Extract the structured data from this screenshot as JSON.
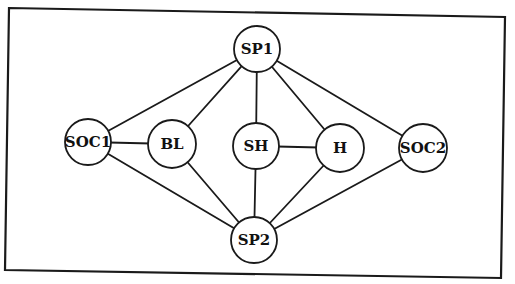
{
  "diagram": {
    "type": "undirected-graph",
    "frame": {
      "points": [
        [
          9,
          8
        ],
        [
          505,
          17
        ],
        [
          501,
          278
        ],
        [
          5,
          270
        ]
      ]
    },
    "nodes": [
      {
        "id": "SP1",
        "label": "SP1",
        "x": 257,
        "y": 49,
        "r": 23
      },
      {
        "id": "SOC1",
        "label": "SOC1",
        "x": 88,
        "y": 142,
        "r": 23
      },
      {
        "id": "BL",
        "label": "BL",
        "x": 172,
        "y": 144,
        "r": 24
      },
      {
        "id": "SH",
        "label": "SH",
        "x": 256,
        "y": 146,
        "r": 23
      },
      {
        "id": "H",
        "label": "H",
        "x": 340,
        "y": 148,
        "r": 24
      },
      {
        "id": "SOC2",
        "label": "SOC2",
        "x": 423,
        "y": 148,
        "r": 24
      },
      {
        "id": "SP2",
        "label": "SP2",
        "x": 254,
        "y": 240,
        "r": 23
      }
    ],
    "edges": [
      [
        "SP1",
        "SOC1"
      ],
      [
        "SP1",
        "BL"
      ],
      [
        "SP1",
        "SH"
      ],
      [
        "SP1",
        "H"
      ],
      [
        "SP1",
        "SOC2"
      ],
      [
        "SP2",
        "SOC1"
      ],
      [
        "SP2",
        "BL"
      ],
      [
        "SP2",
        "SH"
      ],
      [
        "SP2",
        "H"
      ],
      [
        "SP2",
        "SOC2"
      ],
      [
        "SOC1",
        "BL"
      ],
      [
        "SH",
        "H"
      ]
    ]
  }
}
